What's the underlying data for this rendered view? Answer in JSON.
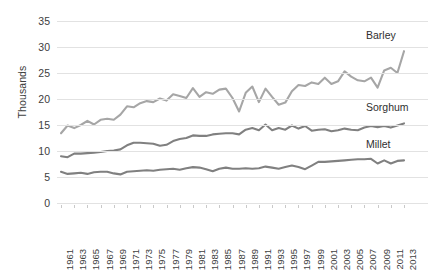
{
  "chart_data": {
    "type": "line",
    "title": "",
    "xlabel": "",
    "ylabel": "Thousands",
    "ylim": [
      0,
      35
    ],
    "ytick_step": 5,
    "yticks": [
      35,
      30,
      25,
      20,
      15,
      10,
      5,
      0
    ],
    "grid": true,
    "legend_position": "end-of-line-labels",
    "x_tick_rotation": "vertical",
    "x": [
      1961,
      1962,
      1963,
      1964,
      1965,
      1966,
      1967,
      1968,
      1969,
      1970,
      1971,
      1972,
      1973,
      1974,
      1975,
      1976,
      1977,
      1978,
      1979,
      1980,
      1981,
      1982,
      1983,
      1984,
      1985,
      1986,
      1987,
      1988,
      1989,
      1990,
      1991,
      1992,
      1993,
      1994,
      1995,
      1996,
      1997,
      1998,
      1999,
      2000,
      2001,
      2002,
      2003,
      2004,
      2005,
      2006,
      2007,
      2008,
      2009,
      2010,
      2011,
      2012,
      2013
    ],
    "x_tick_labels": [
      "1961",
      "1963",
      "1965",
      "1967",
      "1969",
      "1971",
      "1973",
      "1975",
      "1977",
      "1979",
      "1981",
      "1983",
      "1985",
      "1987",
      "1989",
      "1991",
      "1993",
      "1995",
      "1997",
      "1999",
      "2001",
      "2003",
      "2005",
      "2007",
      "2009",
      "2011",
      "2013"
    ],
    "series": [
      {
        "name": "Barley",
        "color": "#a6a6a6",
        "values": [
          13.4,
          14.9,
          14.4,
          15.0,
          15.8,
          15.1,
          16.0,
          16.2,
          16.0,
          17.0,
          18.6,
          18.4,
          19.2,
          19.6,
          19.4,
          20.1,
          19.7,
          20.9,
          20.6,
          20.2,
          22.1,
          20.4,
          21.3,
          21.0,
          21.8,
          22.0,
          20.2,
          17.6,
          21.2,
          22.4,
          19.4,
          22.0,
          20.4,
          18.9,
          19.3,
          21.5,
          22.7,
          22.5,
          23.2,
          22.9,
          24.1,
          22.9,
          23.4,
          25.3,
          24.3,
          23.6,
          23.4,
          24.1,
          22.2,
          25.5,
          26.0,
          25.0,
          29.2
        ]
      },
      {
        "name": "Sorghum",
        "color": "#808080",
        "values": [
          9.0,
          8.8,
          9.5,
          9.5,
          9.6,
          9.7,
          9.8,
          10.0,
          10.1,
          10.3,
          11.1,
          11.6,
          11.6,
          11.5,
          11.4,
          11.0,
          11.2,
          11.9,
          12.3,
          12.5,
          13.0,
          12.9,
          12.9,
          13.2,
          13.3,
          13.4,
          13.4,
          13.2,
          14.1,
          14.4,
          14.0,
          15.1,
          14.0,
          14.4,
          14.1,
          14.9,
          14.3,
          14.8,
          13.9,
          14.1,
          14.2,
          13.8,
          14.0,
          14.3,
          14.1,
          14.0,
          14.5,
          14.8,
          14.6,
          14.8,
          14.5,
          14.9,
          15.3
        ]
      },
      {
        "name": "Millet",
        "color": "#808080",
        "values": [
          6.0,
          5.6,
          5.7,
          5.8,
          5.6,
          5.9,
          6.0,
          6.0,
          5.7,
          5.5,
          6.0,
          6.1,
          6.2,
          6.3,
          6.2,
          6.4,
          6.5,
          6.6,
          6.4,
          6.7,
          6.9,
          6.8,
          6.5,
          6.1,
          6.6,
          6.8,
          6.6,
          6.6,
          6.7,
          6.6,
          6.7,
          7.0,
          6.8,
          6.6,
          6.9,
          7.2,
          6.9,
          6.5,
          7.2,
          7.9,
          7.9,
          8.0,
          8.1,
          8.2,
          8.3,
          8.4,
          8.4,
          8.5,
          7.6,
          8.2,
          7.6,
          8.1,
          8.2
        ]
      }
    ]
  },
  "axis": {
    "y_label": "Thousands"
  }
}
